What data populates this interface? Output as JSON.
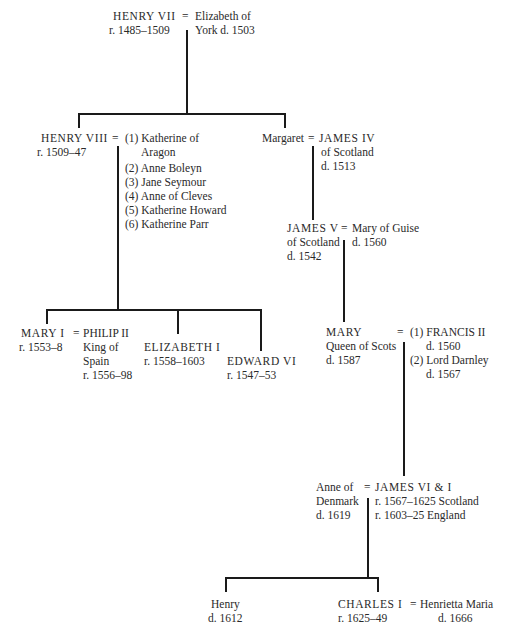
{
  "people": {
    "henry7": {
      "name": "HENRY VII",
      "line2": "r. 1485–1509"
    },
    "elizabeth_york": {
      "name": "Elizabeth of",
      "line2": "York d. 1503"
    },
    "henry8": {
      "name": "HENRY VIII",
      "line2": "r. 1509–47"
    },
    "henry8_wives": [
      "(1) Katherine of",
      "Aragon",
      "(2) Anne Boleyn",
      "(3) Jane Seymour",
      "(4) Anne of Cleves",
      "(5) Katherine Howard",
      "(6) Katherine Parr"
    ],
    "margaret": {
      "name": "Margaret"
    },
    "james4": {
      "name": "JAMES IV",
      "line2": "of Scotland",
      "line3": "d. 1513"
    },
    "james5": {
      "name": "JAMES V",
      "line2": "of Scotland",
      "line3": "d. 1542"
    },
    "mary_guise": {
      "name": "Mary of Guise",
      "line2": "d. 1560"
    },
    "mary1": {
      "name": "MARY I",
      "line2": "r. 1553–8"
    },
    "philip2": {
      "name": "PHILIP II",
      "line2": "King of",
      "line3": "Spain",
      "line4": "r. 1556–98"
    },
    "elizabeth1": {
      "name": "ELIZABETH I",
      "line2": "r. 1558–1603"
    },
    "edward6": {
      "name": "EDWARD VI",
      "line2": "r. 1547–53"
    },
    "mary_scots": {
      "name": "MARY",
      "line2": "Queen of Scots",
      "line3": "d. 1587"
    },
    "mary_scots_spouses": [
      "(1) FRANCIS II",
      "d. 1560",
      "(2) Lord Darnley",
      "d. 1567"
    ],
    "anne_denmark": {
      "name": "Anne of",
      "line2": "Denmark",
      "line3": "d. 1619"
    },
    "james6": {
      "name": "JAMES VI & I",
      "line2": "r. 1567–1625 Scotland",
      "line3": "r. 1603–25 England"
    },
    "henry_prince": {
      "name": "Henry",
      "line2": "d. 1612"
    },
    "charles1": {
      "name": "CHARLES I",
      "line2": "r. 1625–49"
    },
    "henrietta": {
      "name": "Henrietta Maria",
      "line2": "d. 1666"
    }
  },
  "symbols": {
    "marriage": "="
  }
}
